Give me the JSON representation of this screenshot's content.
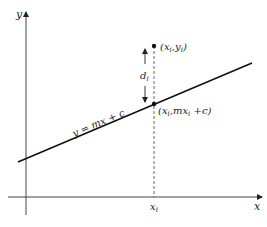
{
  "diagram": {
    "type": "linear-regression-residual",
    "axes": {
      "x_label": "x",
      "y_label": "y"
    },
    "line": {
      "equation_label": "y = mx + c",
      "color": "#111111"
    },
    "data_point": {
      "label": "(x_i, y_i)",
      "label_main": "(x",
      "label_sub1": "i",
      "label_mid": ",y",
      "label_sub2": "i",
      "label_end": ")"
    },
    "line_point": {
      "label": "(x_i, mx_i + c)",
      "label_main": "(x",
      "label_sub1": "i",
      "label_mid": ",mx",
      "label_sub2": "i",
      "label_end": " +c)"
    },
    "residual": {
      "label": "d_i",
      "label_main": "d",
      "label_sub": "i"
    },
    "x_tick": {
      "label": "x_i",
      "label_main": "x",
      "label_sub": "i"
    },
    "colors": {
      "axis": "#444444",
      "line": "#111111",
      "dashed": "#555555",
      "text": "#222222"
    }
  }
}
